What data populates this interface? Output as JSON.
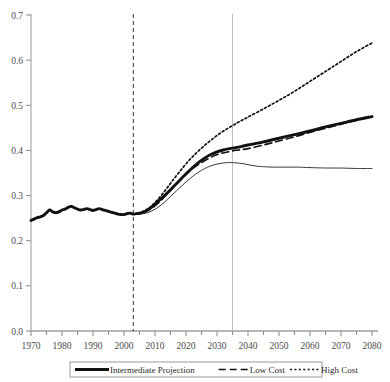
{
  "chart_data": {
    "type": "line",
    "title": "",
    "xlabel": "",
    "ylabel": "",
    "xlim": [
      1970,
      2080
    ],
    "ylim": [
      0.0,
      0.7
    ],
    "grid": false,
    "legend_position": "bottom",
    "y_ticks": [
      "0.0",
      "0.1",
      "0.2",
      "0.3",
      "0.4",
      "0.5",
      "0.6",
      "0.7"
    ],
    "y_tick_values": [
      0.0,
      0.1,
      0.2,
      0.3,
      0.4,
      0.5,
      0.6,
      0.7
    ],
    "x_ticks": [
      "1970",
      "1980",
      "1990",
      "2000",
      "2010",
      "2020",
      "2030",
      "2040",
      "2050",
      "2060",
      "2070",
      "2080"
    ],
    "x_tick_values": [
      1970,
      1980,
      1990,
      2000,
      2010,
      2020,
      2030,
      2040,
      2050,
      2060,
      2070,
      2080
    ],
    "x_minor_tick_interval": 5,
    "annotations": [
      {
        "name": "history-projection-divider",
        "type": "vline",
        "x": 2003,
        "style": "dashed",
        "color": "#333333"
      },
      {
        "name": "trust-fund-marker",
        "type": "vline",
        "x": 2035,
        "style": "solid",
        "color": "#bdbdbd"
      }
    ],
    "series": [
      {
        "name": "Intermediate Projection",
        "style": "solid-thick",
        "color": "#111111",
        "x": [
          1970,
          1971,
          1972,
          1973,
          1974,
          1975,
          1976,
          1977,
          1978,
          1979,
          1980,
          1981,
          1982,
          1983,
          1984,
          1985,
          1986,
          1987,
          1988,
          1989,
          1990,
          1991,
          1992,
          1993,
          1994,
          1995,
          1996,
          1997,
          1998,
          1999,
          2000,
          2001,
          2002,
          2003,
          2004,
          2005,
          2006,
          2007,
          2008,
          2009,
          2010,
          2012,
          2014,
          2016,
          2018,
          2020,
          2022,
          2024,
          2026,
          2028,
          2030,
          2032,
          2034,
          2036,
          2038,
          2040,
          2045,
          2050,
          2055,
          2060,
          2065,
          2070,
          2075,
          2080
        ],
        "y": [
          0.245,
          0.248,
          0.251,
          0.253,
          0.256,
          0.262,
          0.268,
          0.264,
          0.262,
          0.264,
          0.268,
          0.27,
          0.274,
          0.276,
          0.273,
          0.27,
          0.268,
          0.269,
          0.271,
          0.269,
          0.267,
          0.269,
          0.271,
          0.269,
          0.267,
          0.265,
          0.263,
          0.261,
          0.259,
          0.258,
          0.258,
          0.26,
          0.261,
          0.259,
          0.26,
          0.261,
          0.263,
          0.266,
          0.27,
          0.275,
          0.281,
          0.293,
          0.306,
          0.32,
          0.334,
          0.348,
          0.361,
          0.373,
          0.383,
          0.391,
          0.397,
          0.401,
          0.404,
          0.406,
          0.409,
          0.412,
          0.419,
          0.427,
          0.435,
          0.443,
          0.452,
          0.46,
          0.468,
          0.475
        ]
      },
      {
        "name": "Low Cost",
        "style": "dashed",
        "color": "#111111",
        "x": [
          2003,
          2005,
          2007,
          2009,
          2011,
          2013,
          2015,
          2017,
          2019,
          2021,
          2023,
          2025,
          2027,
          2029,
          2031,
          2033,
          2035,
          2037,
          2040,
          2045,
          2050,
          2055,
          2060,
          2065,
          2070,
          2075,
          2080
        ],
        "y": [
          0.259,
          0.26,
          0.264,
          0.272,
          0.283,
          0.297,
          0.312,
          0.327,
          0.341,
          0.353,
          0.364,
          0.373,
          0.381,
          0.388,
          0.393,
          0.396,
          0.399,
          0.401,
          0.404,
          0.412,
          0.421,
          0.43,
          0.44,
          0.449,
          0.458,
          0.467,
          0.474
        ]
      },
      {
        "name": "High Cost",
        "style": "dotted",
        "color": "#111111",
        "x": [
          2003,
          2005,
          2007,
          2009,
          2011,
          2013,
          2015,
          2017,
          2019,
          2021,
          2023,
          2025,
          2027,
          2029,
          2031,
          2033,
          2035,
          2037,
          2040,
          2045,
          2050,
          2055,
          2060,
          2065,
          2070,
          2075,
          2080
        ],
        "y": [
          0.259,
          0.262,
          0.268,
          0.278,
          0.292,
          0.309,
          0.327,
          0.345,
          0.362,
          0.378,
          0.392,
          0.405,
          0.417,
          0.428,
          0.438,
          0.447,
          0.455,
          0.463,
          0.474,
          0.492,
          0.511,
          0.531,
          0.553,
          0.575,
          0.597,
          0.619,
          0.638
        ]
      },
      {
        "name": "Low Cost Alternate",
        "style": "solid-thin",
        "color": "#3a3a3a",
        "x": [
          2003,
          2005,
          2007,
          2009,
          2011,
          2013,
          2015,
          2017,
          2019,
          2021,
          2023,
          2025,
          2027,
          2029,
          2031,
          2033,
          2035,
          2037,
          2039,
          2041,
          2043,
          2045,
          2048,
          2052,
          2056,
          2060,
          2065,
          2070,
          2075,
          2080
        ],
        "y": [
          0.259,
          0.259,
          0.261,
          0.266,
          0.274,
          0.285,
          0.298,
          0.311,
          0.324,
          0.336,
          0.347,
          0.356,
          0.363,
          0.368,
          0.371,
          0.373,
          0.373,
          0.372,
          0.37,
          0.367,
          0.365,
          0.364,
          0.363,
          0.363,
          0.363,
          0.362,
          0.361,
          0.361,
          0.36,
          0.36
        ]
      }
    ]
  },
  "legend": {
    "items": [
      {
        "label": "Intermediate Projection",
        "style": "solid-thick"
      },
      {
        "label": "Low Cost",
        "style": "dashed"
      },
      {
        "label": "High Cost",
        "style": "dotted"
      }
    ]
  }
}
